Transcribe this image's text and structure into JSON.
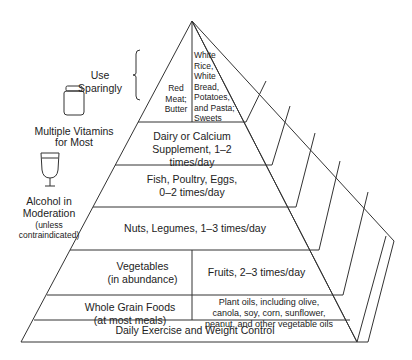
{
  "side_labels": {
    "use_sparingly": "Use Sparingly",
    "vitamins_line1": "Multiple Vitamins",
    "vitamins_line2": "for Most",
    "alcohol_line1": "Alcohol in",
    "alcohol_line2": "Moderation",
    "alcohol_line3": "(unless",
    "alcohol_line4": "contraindicated)"
  },
  "tiers": {
    "top_left": [
      "Red",
      "Meat;",
      "Butter"
    ],
    "top_right": [
      "White",
      "Rice,",
      "White",
      "Bread,",
      "Potatoes,",
      "and Pasta;",
      "Sweets"
    ],
    "dairy": [
      "Dairy or Calcium",
      "Supplement, 1–2 times/day"
    ],
    "fish": [
      "Fish, Poultry, Eggs,",
      "0–2 times/day"
    ],
    "nuts": "Nuts, Legumes, 1–3 times/day",
    "vegetables": [
      "Vegetables",
      "(in abundance)"
    ],
    "fruits": "Fruits, 2–3 times/day",
    "grains": [
      "Whole Grain Foods",
      "(at most meals)"
    ],
    "oils": [
      "Plant oils, including olive,",
      "canola, soy, corn, sunflower,",
      "peanut, and other vegetable oils"
    ],
    "base": "Daily Exercise and Weight Control"
  },
  "icons": [
    "vitamin-bottle-icon",
    "wine-glass-icon",
    "bracket-icon"
  ]
}
